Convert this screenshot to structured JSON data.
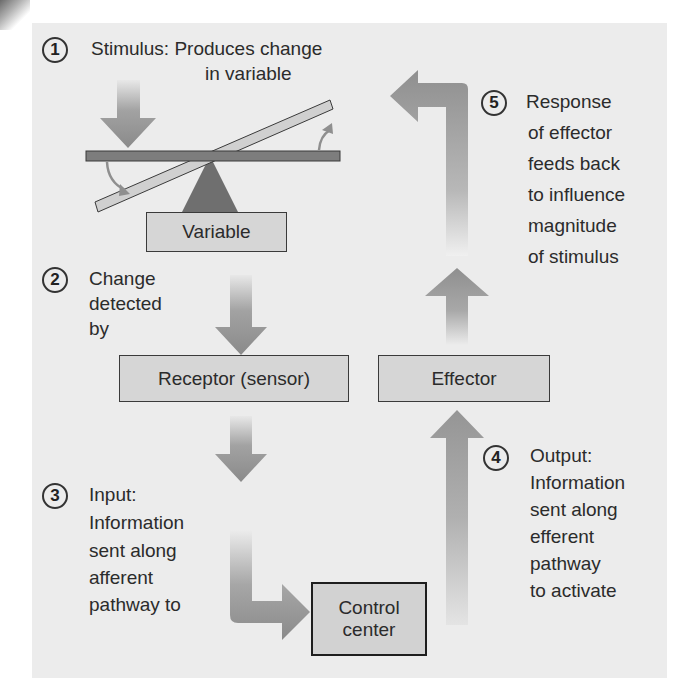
{
  "figure": {
    "colors": {
      "panel_background": "#ececec",
      "arrow": "#8f8f8f",
      "box_fill": "#d6d6d6",
      "box_border": "#3a3a3a",
      "seesaw_bar": "#7d7d7d",
      "seesaw_tilted": "#d0d0d0",
      "fulcrum": "#6f6f6f"
    }
  },
  "steps": [
    {
      "number": "1",
      "lines": [
        "Stimulus: Produces change",
        "in variable"
      ]
    },
    {
      "number": "2",
      "lines": [
        "Change",
        "detected",
        "by"
      ]
    },
    {
      "number": "3",
      "lines": [
        "Input:",
        "Information",
        "sent along",
        "afferent",
        "pathway to"
      ]
    },
    {
      "number": "4",
      "lines": [
        "Output:",
        "Information",
        "sent along",
        "efferent",
        "pathway",
        "to activate"
      ]
    },
    {
      "number": "5",
      "lines": [
        "Response",
        "of effector",
        "feeds back",
        "to influence",
        "magnitude",
        "of stimulus"
      ]
    }
  ],
  "boxes": {
    "variable": "Variable",
    "receptor": "Receptor (sensor)",
    "effector": "Effector",
    "control_center_line1": "Control",
    "control_center_line2": "center"
  }
}
